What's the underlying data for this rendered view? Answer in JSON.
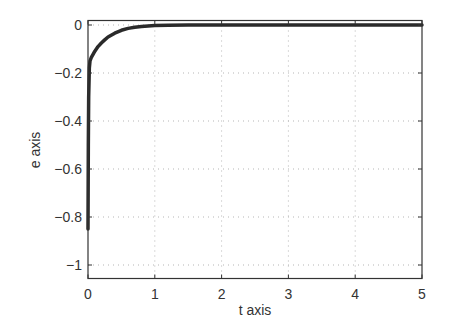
{
  "chart_data": {
    "type": "line",
    "title": "",
    "xlabel": "t axis",
    "ylabel": "e axis",
    "xlim": [
      0,
      5
    ],
    "ylim": [
      -1.05,
      0.02
    ],
    "xticks": [
      0,
      1,
      2,
      3,
      4,
      5
    ],
    "xtick_labels": [
      "0",
      "1",
      "2",
      "3",
      "4",
      "5"
    ],
    "yticks": [
      0,
      -0.2,
      -0.4,
      -0.6,
      -0.8,
      -1
    ],
    "ytick_labels": [
      "0",
      "−0.2",
      "−0.4",
      "−0.6",
      "−0.8",
      "−1"
    ],
    "grid": true,
    "grid_style": "dotted",
    "legend": null,
    "series": [
      {
        "name": "e(t)",
        "color": "#2a2a2a",
        "x": [
          0,
          0.005,
          0.01,
          0.02,
          0.03,
          0.05,
          0.08,
          0.1,
          0.15,
          0.2,
          0.25,
          0.3,
          0.4,
          0.5,
          0.6,
          0.7,
          0.8,
          0.9,
          1.0,
          1.2,
          1.5,
          2,
          3,
          4,
          5
        ],
        "values": [
          -0.85,
          -0.5,
          -0.3,
          -0.18,
          -0.15,
          -0.135,
          -0.12,
          -0.11,
          -0.09,
          -0.075,
          -0.062,
          -0.05,
          -0.034,
          -0.022,
          -0.014,
          -0.009,
          -0.006,
          -0.004,
          -0.002,
          -0.001,
          0,
          0,
          0,
          0,
          0
        ]
      }
    ]
  }
}
